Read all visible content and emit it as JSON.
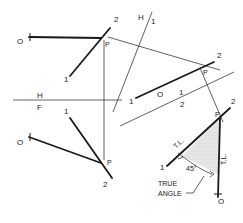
{
  "diagram": {
    "colors": {
      "line": "#1a1a1a",
      "construction": "#3a3a3a",
      "shade": "#c8c8c8",
      "background": "#ffffff"
    },
    "top_view": {
      "point_O": "O",
      "line_end_1": "1",
      "line_end_2": "2",
      "point_P": "P"
    },
    "folding_line_HF": {
      "upper": "H",
      "lower": "F"
    },
    "front_view": {
      "point_O": "O",
      "line_end_1": "1",
      "line_end_2": "2",
      "point_P": "P"
    },
    "folding_line_H1": {
      "left": "H",
      "right": "1"
    },
    "aux_view_1": {
      "line_end_1": "1",
      "point_O": "O",
      "line_end_2": "2",
      "point_P": "P"
    },
    "folding_line_12": {
      "upper": "1",
      "lower": "2"
    },
    "aux_view_2": {
      "line_end_1": "1",
      "line_end_2": "2",
      "point_P": "P",
      "point_O": "O",
      "true_length_label_1": "T.L.",
      "true_length_label_2": "T.L.",
      "angle_value": "45°",
      "callout": [
        "TRUE",
        "ANGLE"
      ]
    }
  }
}
